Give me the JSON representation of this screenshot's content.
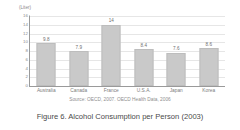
{
  "chart_data": {
    "type": "bar",
    "title": "",
    "xlabel": "",
    "ylabel": "(Liter)",
    "unit_label": "(Liter)",
    "categories": [
      "Australia",
      "Canada",
      "France",
      "U.S.A.",
      "Japan",
      "Korea"
    ],
    "values": [
      9.8,
      7.9,
      14,
      8.4,
      7.6,
      8.6
    ],
    "value_labels": [
      "9.8",
      "7.9",
      "14",
      "8.4",
      "7.6",
      "8.6"
    ],
    "ylim": [
      0,
      16
    ],
    "ytick_labels": [
      "0",
      "2",
      "4",
      "6",
      "8",
      "10",
      "12",
      "14",
      "16"
    ],
    "yticks": [
      0,
      2,
      4,
      6,
      8,
      10,
      12,
      14,
      16
    ],
    "grid": true,
    "legend": null,
    "bar_color": "#c9c9c9",
    "axis_color": "#9a9a9a",
    "gridline_color": "#e6e6e6",
    "source_note": "Source: OECD, 2007. OECD Health Data, 2006",
    "caption": "Figure 6. Alcohol Consumption per Person (2003)"
  }
}
